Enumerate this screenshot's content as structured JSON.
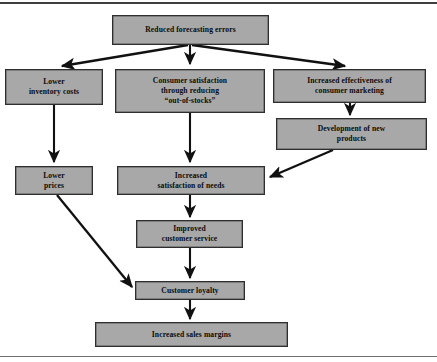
{
  "diagram": {
    "box_fill": "#a8a8a8",
    "box_border": "#2e2e2e",
    "arrow_color": "#111111",
    "nodes": [
      {
        "id": "reduced-forecasting-errors",
        "label": "Reduced forecasting errors",
        "x": 112,
        "y": 15,
        "w": 157,
        "h": 30
      },
      {
        "id": "lower-inventory-costs",
        "label": "Lower\ninventory costs",
        "x": 5,
        "y": 69,
        "w": 98,
        "h": 36
      },
      {
        "id": "consumer-satisfaction",
        "label": "Consumer satisfaction\nthrough reducing\n“out-of-stocks”",
        "x": 115,
        "y": 69,
        "w": 150,
        "h": 44
      },
      {
        "id": "increased-effectiveness",
        "label": "Increased effectiveness of\nconsumer marketing",
        "x": 273,
        "y": 69,
        "w": 153,
        "h": 34
      },
      {
        "id": "development-of-new-products",
        "label": "Development of new\nproducts",
        "x": 276,
        "y": 118,
        "w": 151,
        "h": 32
      },
      {
        "id": "lower-prices",
        "label": "Lower\nprices",
        "x": 15,
        "y": 166,
        "w": 78,
        "h": 29
      },
      {
        "id": "increased-satisfaction-of-needs",
        "label": "Increased\nsatisfaction of needs",
        "x": 117,
        "y": 166,
        "w": 148,
        "h": 29
      },
      {
        "id": "improved-customer-service",
        "label": "Improved\ncustomer service",
        "x": 136,
        "y": 220,
        "w": 107,
        "h": 28
      },
      {
        "id": "customer-loyalty",
        "label": "Customer loyalty",
        "x": 135,
        "y": 281,
        "w": 110,
        "h": 19
      },
      {
        "id": "increased-sales-margins",
        "label": "Increased sales margins",
        "x": 95,
        "y": 322,
        "w": 193,
        "h": 25
      }
    ],
    "edges": [
      {
        "id": "edge-top-to-lower-inventory",
        "from": "reduced-forecasting-errors",
        "to": "lower-inventory-costs",
        "path": "M 188 45 L 62 66",
        "style": "diagonal"
      },
      {
        "id": "edge-top-to-consumer-satisfaction",
        "from": "reduced-forecasting-errors",
        "to": "consumer-satisfaction",
        "path": "M 190 45 L 190 64",
        "style": "straight"
      },
      {
        "id": "edge-top-to-increased-effectiveness",
        "from": "reduced-forecasting-errors",
        "to": "increased-effectiveness",
        "path": "M 192 45 L 345 66",
        "style": "diagonal"
      },
      {
        "id": "edge-inventory-to-prices",
        "from": "lower-inventory-costs",
        "to": "lower-prices",
        "path": "M 54 105 L 54 162",
        "style": "straight"
      },
      {
        "id": "edge-satisfaction-to-needs",
        "from": "consumer-satisfaction",
        "to": "increased-satisfaction-of-needs",
        "path": "M 190 113 L 190 162",
        "style": "straight"
      },
      {
        "id": "edge-effectiveness-to-development",
        "from": "increased-effectiveness",
        "to": "development-of-new-products",
        "path": "M 350 103 L 350 115",
        "style": "straight"
      },
      {
        "id": "edge-development-to-needs",
        "from": "development-of-new-products",
        "to": "increased-satisfaction-of-needs",
        "path": "M 333 150 L 270 177",
        "style": "diagonal"
      },
      {
        "id": "edge-needs-to-service",
        "from": "increased-satisfaction-of-needs",
        "to": "improved-customer-service",
        "path": "M 190 195 L 190 217",
        "style": "straight"
      },
      {
        "id": "edge-service-to-loyalty",
        "from": "improved-customer-service",
        "to": "customer-loyalty",
        "path": "M 190 248 L 190 278",
        "style": "straight"
      },
      {
        "id": "edge-prices-to-loyalty",
        "from": "lower-prices",
        "to": "customer-loyalty",
        "path": "M 57 195 L 132 287",
        "style": "diagonal"
      },
      {
        "id": "edge-loyalty-to-margins",
        "from": "customer-loyalty",
        "to": "increased-sales-margins",
        "path": "M 190 300 L 190 319",
        "style": "straight"
      }
    ]
  }
}
